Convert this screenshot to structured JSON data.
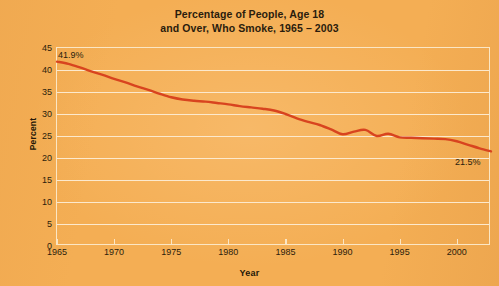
{
  "chart_data": {
    "type": "line",
    "title": "Percentage of People, Age 18 and Over, Who Smoke, 1965 – 2003",
    "title_line1": "Percentage of People, Age 18",
    "title_line2": "and Over, Who Smoke, 1965 – 2003",
    "xlabel": "Year",
    "ylabel": "Percent",
    "xlim": [
      1965,
      2003
    ],
    "ylim": [
      0,
      45
    ],
    "ytick_labels": [
      "45",
      "40",
      "35",
      "30",
      "25",
      "20",
      "15",
      "10",
      "5",
      "0"
    ],
    "ytick_values": [
      45,
      40,
      35,
      30,
      25,
      20,
      15,
      10,
      5,
      0
    ],
    "xtick_labels": [
      "1965",
      "1970",
      "1975",
      "1980",
      "1985",
      "1990",
      "1995",
      "2000"
    ],
    "xtick_values": [
      1965,
      1970,
      1975,
      1980,
      1985,
      1990,
      1995,
      2000
    ],
    "grid": true,
    "legend": false,
    "line_color": "#d8441f",
    "background_color": "#f4ae54",
    "grid_color": "#fce9cd",
    "x": [
      1965,
      1966,
      1967,
      1968,
      1969,
      1970,
      1971,
      1972,
      1973,
      1974,
      1975,
      1976,
      1977,
      1978,
      1979,
      1980,
      1981,
      1982,
      1983,
      1984,
      1985,
      1986,
      1987,
      1988,
      1989,
      1990,
      1991,
      1992,
      1993,
      1994,
      1995,
      1996,
      1997,
      1998,
      1999,
      2000,
      2001,
      2002,
      2003
    ],
    "values": [
      41.9,
      41.4,
      40.6,
      39.7,
      38.9,
      38.0,
      37.2,
      36.3,
      35.5,
      34.6,
      33.8,
      33.3,
      33.0,
      32.8,
      32.5,
      32.2,
      31.8,
      31.5,
      31.2,
      30.8,
      30.0,
      29.0,
      28.2,
      27.5,
      26.5,
      25.4,
      26.0,
      26.4,
      25.0,
      25.5,
      24.7,
      24.6,
      24.5,
      24.4,
      24.3,
      23.8,
      23.0,
      22.2,
      21.5
    ],
    "annotations": [
      {
        "name": "start-value",
        "text": "41.9%",
        "x": 1965,
        "y": 41.9
      },
      {
        "name": "end-value",
        "text": "21.5%",
        "x": 2003,
        "y": 21.5
      }
    ]
  }
}
